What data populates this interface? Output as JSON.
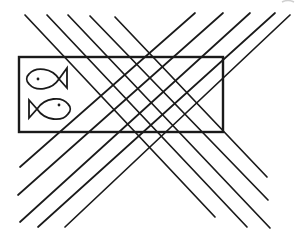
{
  "figure": {
    "stroke_color": "#1a1a1a",
    "background": "#ffffff",
    "rectangle": {
      "x": 19,
      "y": 57,
      "width": 204,
      "height": 75
    },
    "down_right_lines": [
      {
        "x1": 25,
        "y1": 15,
        "x2": 215,
        "y2": 217
      },
      {
        "x1": 47,
        "y1": 15,
        "x2": 247,
        "y2": 227
      },
      {
        "x1": 68,
        "y1": 15,
        "x2": 270,
        "y2": 228
      },
      {
        "x1": 90,
        "y1": 16,
        "x2": 268,
        "y2": 200
      },
      {
        "x1": 115,
        "y1": 17,
        "x2": 267,
        "y2": 177
      }
    ],
    "up_right_lines": [
      {
        "x1": 20,
        "y1": 167,
        "x2": 195,
        "y2": 13
      },
      {
        "x1": 18,
        "y1": 195,
        "x2": 223,
        "y2": 13
      },
      {
        "x1": 20,
        "y1": 222,
        "x2": 250,
        "y2": 13
      },
      {
        "x1": 38,
        "y1": 227,
        "x2": 275,
        "y2": 13
      },
      {
        "x1": 65,
        "y1": 227,
        "x2": 290,
        "y2": 15
      }
    ],
    "fish": [
      {
        "name": "fish-facing-left",
        "direction": "left",
        "eye": {
          "x": 38,
          "y": 79
        }
      },
      {
        "name": "fish-facing-right",
        "direction": "right",
        "eye": {
          "x": 59,
          "y": 105
        }
      }
    ]
  }
}
